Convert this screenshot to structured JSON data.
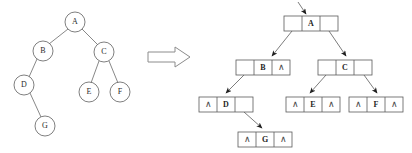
{
  "figure": {
    "implies_symbol": "double-right-arrow"
  },
  "colors": {
    "stroke": "#5a5a5a",
    "text": "#1f1f1f",
    "background": "#ffffff",
    "arrow_outline": "#8c8c8c"
  },
  "tree": {
    "caption": "binary tree",
    "nodes": [
      {
        "id": "A",
        "label": "A",
        "cx": 75,
        "cy": 22
      },
      {
        "id": "B",
        "label": "B",
        "cx": 43,
        "cy": 51
      },
      {
        "id": "C",
        "label": "C",
        "cx": 104,
        "cy": 52
      },
      {
        "id": "D",
        "label": "D",
        "cx": 24,
        "cy": 85
      },
      {
        "id": "E",
        "label": "E",
        "cx": 89,
        "cy": 92
      },
      {
        "id": "F",
        "label": "F",
        "cx": 120,
        "cy": 92
      },
      {
        "id": "G",
        "label": "G",
        "cx": 45,
        "cy": 126
      }
    ],
    "edges": [
      {
        "from": "A",
        "to": "B"
      },
      {
        "from": "A",
        "to": "C"
      },
      {
        "from": "B",
        "to": "D"
      },
      {
        "from": "C",
        "to": "E"
      },
      {
        "from": "C",
        "to": "F"
      },
      {
        "from": "D",
        "to": "G"
      }
    ],
    "radius": 10
  },
  "linked": {
    "caption": "linked representation",
    "null_glyph": "∧",
    "root_pointer_label": "",
    "nodes": [
      {
        "id": "A",
        "label": "A",
        "x": 284,
        "y": 16,
        "left": "pointer",
        "right": "pointer"
      },
      {
        "id": "B",
        "label": "B",
        "x": 236,
        "y": 60,
        "left": "pointer",
        "right": "null"
      },
      {
        "id": "C",
        "label": "C",
        "x": 318,
        "y": 60,
        "left": "pointer",
        "right": "pointer"
      },
      {
        "id": "D",
        "label": "D",
        "x": 199,
        "y": 97,
        "left": "null",
        "right": "pointer"
      },
      {
        "id": "E",
        "label": "E",
        "x": 286,
        "y": 97,
        "left": "null",
        "right": "null"
      },
      {
        "id": "F",
        "label": "F",
        "x": 349,
        "y": 97,
        "left": "null",
        "right": "null"
      },
      {
        "id": "G",
        "label": "G",
        "x": 238,
        "y": 132,
        "left": "null",
        "right": "null"
      }
    ],
    "links": [
      {
        "from": "A",
        "side": "left",
        "to": "B"
      },
      {
        "from": "A",
        "side": "right",
        "to": "C"
      },
      {
        "from": "B",
        "side": "left",
        "to": "D"
      },
      {
        "from": "C",
        "side": "left",
        "to": "E"
      },
      {
        "from": "C",
        "side": "right",
        "to": "F"
      },
      {
        "from": "D",
        "side": "right",
        "to": "G"
      }
    ],
    "box": {
      "width": 54,
      "height": 15,
      "cell_width": 18
    }
  }
}
